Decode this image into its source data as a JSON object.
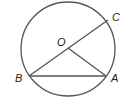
{
  "diagram": {
    "type": "circle-geometry",
    "circle": {
      "center_label": "O",
      "cx": 68,
      "cy": 49,
      "r": 47,
      "stroke": "#555555"
    },
    "points": [
      {
        "label": "O",
        "x": 68,
        "y": 48
      },
      {
        "label": "A",
        "x": 106,
        "y": 76
      },
      {
        "label": "B",
        "x": 29,
        "y": 76
      },
      {
        "label": "C",
        "x": 108,
        "y": 20
      }
    ],
    "segments": [
      {
        "from": "B",
        "to": "C",
        "kind": "diameter"
      },
      {
        "from": "B",
        "to": "A",
        "kind": "chord"
      },
      {
        "from": "O",
        "to": "A",
        "kind": "radius"
      }
    ],
    "labels": {
      "O": "O",
      "A": "A",
      "B": "B",
      "C": "C"
    }
  }
}
